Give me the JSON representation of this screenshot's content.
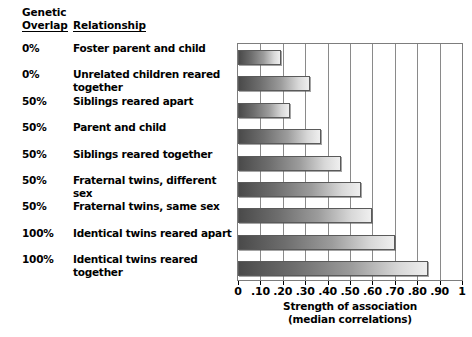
{
  "chart_data": {
    "type": "bar",
    "orientation": "horizontal",
    "title": "",
    "xlabel": "Strength of association",
    "xlabel_sub": "(median correlations)",
    "ylabel": "",
    "xlim": [
      0,
      1
    ],
    "grid": true,
    "legend": false,
    "tick_labels": [
      "0",
      ".10",
      ".20",
      ".30",
      ".40",
      ".50",
      ".60",
      ".70",
      ".80",
      ".90",
      "1"
    ],
    "tick_values": [
      0,
      0.1,
      0.2,
      0.3,
      0.4,
      0.5,
      0.6,
      0.7,
      0.8,
      0.9,
      1
    ],
    "categories": [
      "Foster parent and child",
      "Unrelated children reared together",
      "Siblings reared apart",
      "Parent and child",
      "Siblings reared together",
      "Fraternal twins, different sex",
      "Fraternal twins, same sex",
      "Identical twins reared apart",
      "Identical twins reared together"
    ],
    "values": [
      0.19,
      0.32,
      0.23,
      0.37,
      0.46,
      0.55,
      0.6,
      0.7,
      0.85
    ]
  },
  "table": {
    "header": {
      "genetic": "Genetic",
      "overlap": "Overlap",
      "relationship": "Relationship"
    },
    "rows": [
      {
        "overlap": "0%",
        "relationship": "Foster parent and child",
        "value": 0.19
      },
      {
        "overlap": "0%",
        "relationship": "Unrelated children reared together",
        "value": 0.32
      },
      {
        "overlap": "50%",
        "relationship": "Siblings reared apart",
        "value": 0.23
      },
      {
        "overlap": "50%",
        "relationship": "Parent and child",
        "value": 0.37
      },
      {
        "overlap": "50%",
        "relationship": "Siblings reared together",
        "value": 0.46
      },
      {
        "overlap": "50%",
        "relationship": "Fraternal twins, different sex",
        "value": 0.55
      },
      {
        "overlap": "50%",
        "relationship": "Fraternal twins, same sex",
        "value": 0.6
      },
      {
        "overlap": "100%",
        "relationship": "Identical twins reared apart",
        "value": 0.7
      },
      {
        "overlap": "100%",
        "relationship": "Identical twins reared together",
        "value": 0.85
      }
    ]
  },
  "colors": {
    "bar_dark": "#4a4a4a",
    "bar_light": "#efefef",
    "bar_border": "#5a5a5a",
    "gridline": "#8a8a8a",
    "frame": "#7d7d7d",
    "background": "#ffffff",
    "text": "#000000"
  }
}
